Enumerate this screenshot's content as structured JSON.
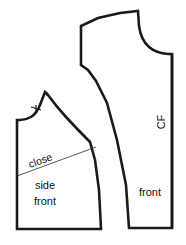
{
  "figure": {
    "kind": "sewing-pattern-diagram",
    "background_color": "#ffffff",
    "outline_color": "#1a1a1a",
    "fill_color": "#ffffff",
    "guide_line_color": "#2a2a2a",
    "text_color": "#101010",
    "width": 186,
    "height": 245
  },
  "labels": {
    "close": "close",
    "side": "side",
    "front_lower": "front",
    "front_right": "front",
    "cf": "CF"
  },
  "pieces": [
    {
      "id": "side-front",
      "name": "side front",
      "label_lines": [
        "side",
        "front"
      ],
      "has_dart_guide": true,
      "dart_guide_label": "close",
      "notch_count": 1
    },
    {
      "id": "front",
      "name": "front",
      "label_lines": [
        "front"
      ],
      "grainline_label": "CF",
      "has_dart_guide": false,
      "notch_count": 0
    }
  ]
}
